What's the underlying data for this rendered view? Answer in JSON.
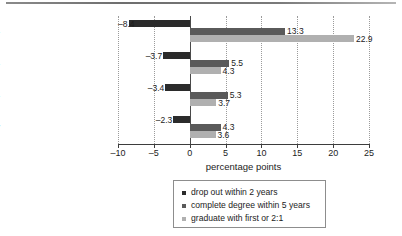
{
  "figure": {
    "top_rule": "horizontal-rule"
  },
  "chart_data": {
    "type": "bar",
    "orientation": "horizontal",
    "title": "",
    "xlabel": "percentage points",
    "ylabel": "",
    "xlim": [
      -10,
      25
    ],
    "xticks": [
      -10,
      -5,
      0,
      5,
      10,
      15,
      20,
      25
    ],
    "xticklabels": [
      "–10",
      "–5",
      "0",
      "5",
      "10",
      "15",
      "20",
      "25"
    ],
    "grid": true,
    "grid_axis": "x",
    "legend_position": "bottom-center",
    "categories": [
      "raw differences",
      "pre-university controls",
      "same courses",
      "high status institutions only"
    ],
    "series": [
      {
        "name": "drop out within 2 years",
        "color": "#2b2b2b",
        "values": [
          -8.4,
          -3.7,
          -3.4,
          -2.3
        ],
        "labels": [
          "–8.4",
          "–3.7",
          "–3.4",
          "–2.3"
        ]
      },
      {
        "name": "complete degree within 5 years",
        "color": "#5a5a5a",
        "values": [
          13.3,
          5.5,
          5.3,
          4.3
        ],
        "labels": [
          "13.3",
          "5.5",
          "5.3",
          "4.3"
        ]
      },
      {
        "name": "graduate with first or 2:1",
        "color": "#b0b0b0",
        "values": [
          22.9,
          4.3,
          3.7,
          3.6
        ],
        "labels": [
          "22.9",
          "4.3",
          "3.7",
          "3.6"
        ]
      }
    ]
  },
  "legend": {
    "items": [
      {
        "label": "drop out within 2 years",
        "color": "#2b2b2b"
      },
      {
        "label": "complete degree within 5 years",
        "color": "#5a5a5a"
      },
      {
        "label": "graduate with first or 2:1",
        "color": "#b0b0b0"
      }
    ]
  }
}
